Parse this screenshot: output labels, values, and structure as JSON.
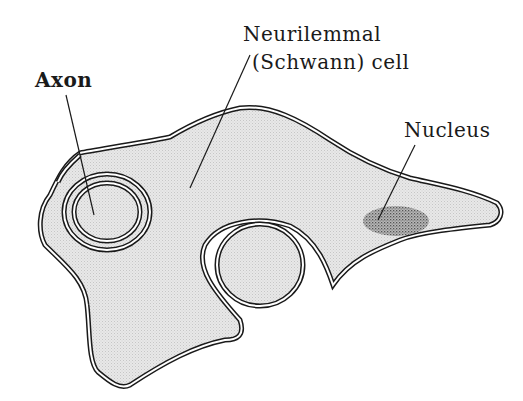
{
  "diagram": {
    "labels": {
      "axon": {
        "initial": "A",
        "rest": "xon",
        "full": "Axon"
      },
      "schwann_line1": {
        "initial": "N",
        "rest": "eurilemmal",
        "full": "Neurilemmal"
      },
      "schwann_line2": "(Schwann) cell",
      "nucleus": {
        "initial": "N",
        "rest": "ucleus",
        "full": "Nucleus"
      }
    },
    "colors": {
      "membrane": "#1a1a1a",
      "cytoplasm": "#e4e4e4",
      "nucleus": "#8a8a8a",
      "background": "#ffffff"
    }
  }
}
